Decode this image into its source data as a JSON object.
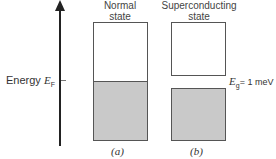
{
  "axis": {
    "label": "Energy",
    "fermi_symbol": "E",
    "fermi_sub": "F"
  },
  "panels": [
    {
      "title_line1": "Normal",
      "title_line2": "state",
      "caption": "(a)"
    },
    {
      "title_line1": "Superconducting",
      "title_line2": "state",
      "caption": "(b)"
    }
  ],
  "gap": {
    "symbol": "E",
    "sub": "g",
    "value": "= 1 meV"
  },
  "colors": {
    "filled": "#c9c9c9",
    "border": "#555555"
  }
}
